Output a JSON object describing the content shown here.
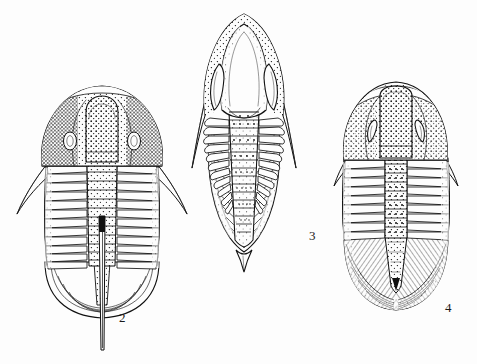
{
  "plate": {
    "title": "Trilobite specimens plate",
    "background_color": "#fdfdfd",
    "ink_color": "#111111",
    "medium": "pen-and-ink stipple line drawing",
    "width": 477,
    "height": 364,
    "specimen_count": 3
  },
  "figures": [
    {
      "id": "fig-2",
      "label": "2",
      "label_x": 119,
      "label_y": 322,
      "common_name": "trilobite with long telson spine",
      "bbox": {
        "x": 14,
        "y": 82,
        "width": 176,
        "height": 268
      },
      "parts": {
        "cephalon": "broad semicircular head shield, heavily stippled, with raised stippled glabella",
        "glabella": "elongate rounded axial lobe, dense stipple",
        "eyes": "small pale oval eyes on either side of glabella",
        "genal_spines": "two long slender spines sweeping backward and outward",
        "thorax_segments": 14,
        "pygidium": "small rounded tail shield with fine ribs",
        "telson": "very long straight terminal spine extending well below body"
      }
    },
    {
      "id": "fig-3",
      "label": "3",
      "label_x": 313,
      "label_y": 240,
      "common_name": "trilobite with bulbous glabella and pygidial spine",
      "bbox": {
        "x": 189,
        "y": 12,
        "width": 160,
        "height": 250
      },
      "parts": {
        "cephalon": "tall rounded head shield, stippled on the cheeks",
        "glabella": "large inflated balloon-shaped axial lobe, smooth and pale",
        "eyes": "large crescent-shaped eyes flanking the glabella",
        "genal_spines": "two long tapering spines directed backward",
        "thorax_segments": 11,
        "pygidium": "triangular tail shield with fine ribs",
        "terminal_spine": "short stout pointed spine at rear of pygidium"
      }
    },
    {
      "id": "fig-4",
      "label": "4",
      "label_x": 449,
      "label_y": 312,
      "common_name": "trilobite with broad rounded pygidium",
      "bbox": {
        "x": 333,
        "y": 80,
        "width": 125,
        "height": 232
      },
      "parts": {
        "cephalon": "rounded head shield, densely stippled overall",
        "glabella": "broad stippled axial lobe widening forward",
        "eyes": "crescent C-shaped eyes set close to the glabella",
        "genal_spines": "two short spines at the rear corners of the head",
        "thorax_segments": 13,
        "pygidium": "large broad rounded tail shield with radiating ribs",
        "terminal_spine": "none"
      }
    }
  ]
}
